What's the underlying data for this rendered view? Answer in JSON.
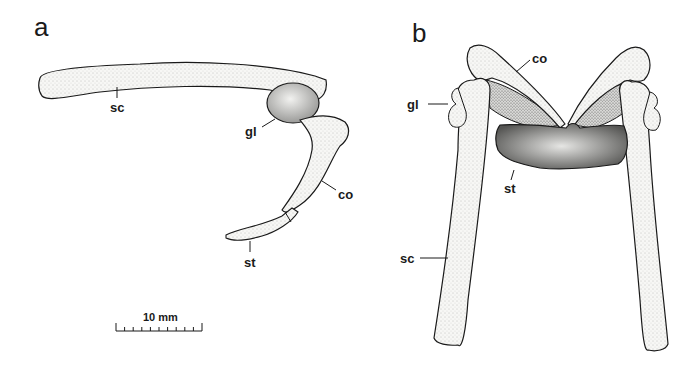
{
  "figure": {
    "panels": [
      {
        "id": "a",
        "label": "a",
        "view": "lateral",
        "annotations": {
          "sc": "sc",
          "gl": "gl",
          "co": "co",
          "st": "st"
        }
      },
      {
        "id": "b",
        "label": "b",
        "view": "anterior",
        "annotations": {
          "co": "co",
          "gl": "gl",
          "st": "st",
          "sc": "sc"
        }
      }
    ],
    "scale_bar": {
      "label": "10 mm",
      "divisions": 10
    },
    "colors": {
      "ink": "#1a1a1a",
      "bone_fill": "#f4f4f2",
      "stipple": "#6a6a6a",
      "background": "#ffffff"
    }
  }
}
